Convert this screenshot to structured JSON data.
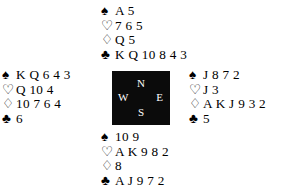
{
  "diagram": {
    "type": "bridge-deal-diagram",
    "background_color": "#ffffff",
    "text_color": "#000000"
  },
  "compass": {
    "background_color": "#0b0b0b",
    "label_color": "#ffffff",
    "north": "N",
    "west": "W",
    "east": "E",
    "south": "S"
  },
  "suits": {
    "spade": {
      "symbol": "♠",
      "name": "spade-suit-symbol",
      "filled": true
    },
    "heart": {
      "symbol": "♡",
      "name": "heart-suit-symbol",
      "filled": false
    },
    "diamond": {
      "symbol": "♢",
      "name": "diamond-suit-symbol",
      "filled": false
    },
    "club": {
      "symbol": "♣",
      "name": "club-suit-symbol",
      "filled": true
    }
  },
  "hands": {
    "north": {
      "position_label": "North",
      "spades": "A 5",
      "hearts": "7 6 5",
      "diamonds": "Q 5",
      "clubs": "K Q 10 8 4 3"
    },
    "west": {
      "position_label": "West",
      "spades": "K Q 6 4 3",
      "hearts": "Q 10 4",
      "diamonds": "10 7 6 4",
      "clubs": "6"
    },
    "east": {
      "position_label": "East",
      "spades": "J 8 7 2",
      "hearts": "J 3",
      "diamonds": "A K J 9 3 2",
      "clubs": "5"
    },
    "south": {
      "position_label": "South",
      "spades": "10 9",
      "hearts": "A K 9 8 2",
      "diamonds": "8",
      "clubs": "A J 9 7 2"
    }
  }
}
